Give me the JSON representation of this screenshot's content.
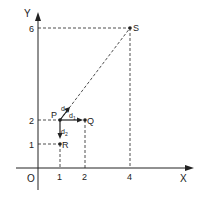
{
  "diagram": {
    "axes": {
      "x_label": "X",
      "y_label": "Y",
      "origin_label": "O",
      "x_ticks": [
        "1",
        "2",
        "4"
      ],
      "y_ticks": [
        "1",
        "2",
        "6"
      ]
    },
    "points": [
      {
        "name": "P",
        "x": 1,
        "y": 2
      },
      {
        "name": "Q",
        "x": 2,
        "y": 2
      },
      {
        "name": "R",
        "x": 1,
        "y": 1
      },
      {
        "name": "S",
        "x": 4,
        "y": 6
      }
    ],
    "distances": {
      "d1": "d1",
      "d2": "d2",
      "d3": "d3"
    },
    "labels": {
      "P": "P",
      "Q": "Q",
      "R": "R",
      "S": "S",
      "d1_base": "d",
      "d1_sub": "1",
      "d2_base": "d",
      "d2_sub": "2",
      "d3_base": "d",
      "d3_sub": "3"
    },
    "colors": {
      "ink": "#222222",
      "background": "#ffffff"
    }
  }
}
